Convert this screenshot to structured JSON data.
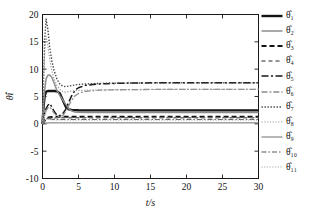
{
  "chart_data": {
    "type": "line",
    "title": "",
    "xlabel": "t/s",
    "ylabel": "θ̂i",
    "xlim": [
      0,
      30
    ],
    "ylim": [
      -10,
      20
    ],
    "xticks": [
      0,
      5,
      10,
      15,
      20,
      25,
      30
    ],
    "yticks": [
      -10,
      -5,
      0,
      5,
      10,
      15,
      20
    ],
    "xticklabels": [
      "0",
      "5",
      "10",
      "15",
      "20",
      "25",
      "30"
    ],
    "yticklabels": [
      "-10",
      "-5",
      "0",
      "5",
      "10",
      "15",
      "20"
    ],
    "grid": false,
    "legend_position": "right-outside",
    "x": [
      0,
      0.15,
      0.3,
      0.5,
      0.75,
      1.0,
      1.3,
      1.6,
      2.0,
      2.4,
      2.8,
      3.2,
      3.6,
      4.0,
      4.5,
      5.0,
      6.0,
      7.0,
      8.0,
      9.0,
      10.0,
      12.0,
      15.0,
      18.0,
      21.0,
      24.0,
      27.0,
      30.0
    ],
    "series": [
      {
        "name": "θ̂₁",
        "label": "θ̂1",
        "color": "#141414",
        "width": 2.4,
        "dash": "none",
        "values": [
          0,
          3.2,
          5.1,
          5.9,
          6.0,
          6.0,
          6.0,
          6.0,
          5.95,
          5.6,
          4.4,
          3.2,
          2.7,
          2.55,
          2.5,
          2.48,
          2.47,
          2.47,
          2.47,
          2.47,
          2.47,
          2.47,
          2.47,
          2.47,
          2.47,
          2.47,
          2.47,
          2.47
        ]
      },
      {
        "name": "θ̂₂",
        "label": "θ̂2",
        "color": "#8c8c8c",
        "width": 1.5,
        "dash": "none",
        "values": [
          0,
          3.6,
          6.2,
          8.2,
          8.9,
          8.95,
          8.5,
          7.5,
          6.1,
          5.2,
          4.4,
          3.6,
          2.9,
          2.4,
          2.15,
          2.1,
          2.08,
          2.08,
          2.08,
          2.08,
          2.08,
          2.08,
          2.08,
          2.08,
          2.08,
          2.08,
          2.08,
          2.08
        ]
      },
      {
        "name": "θ̂₃",
        "label": "θ̂3",
        "color": "#141414",
        "width": 2.0,
        "dash": "5,3",
        "values": [
          0,
          0.3,
          0.6,
          0.9,
          1.1,
          1.2,
          1.25,
          1.3,
          1.3,
          1.3,
          1.3,
          1.3,
          1.3,
          1.3,
          1.3,
          1.3,
          1.3,
          1.3,
          1.3,
          1.3,
          1.3,
          1.3,
          1.3,
          1.3,
          1.3,
          1.3,
          1.3,
          1.3
        ]
      },
      {
        "name": "θ̂₄",
        "label": "θ̂4",
        "color": "#6e6e6e",
        "width": 1.4,
        "dash": "4,3",
        "values": [
          0,
          0.25,
          0.5,
          0.75,
          0.92,
          1.0,
          1.05,
          1.08,
          1.1,
          1.1,
          1.1,
          1.1,
          1.1,
          1.1,
          1.1,
          1.1,
          1.1,
          1.1,
          1.1,
          1.1,
          1.1,
          1.1,
          1.1,
          1.1,
          1.1,
          1.1,
          1.1,
          1.1
        ]
      },
      {
        "name": "θ̂₅",
        "label": "θ̂5",
        "color": "#141414",
        "width": 1.5,
        "dash": "7,2.5,2,2.5",
        "values": [
          0,
          1.0,
          1.9,
          2.8,
          3.4,
          3.7,
          3.1,
          2.3,
          1.6,
          1.5,
          1.8,
          2.6,
          3.8,
          5.0,
          6.1,
          6.6,
          7.05,
          7.2,
          7.3,
          7.35,
          7.4,
          7.45,
          7.5,
          7.5,
          7.5,
          7.5,
          7.5,
          7.5
        ]
      },
      {
        "name": "θ̂₆",
        "label": "θ̂6",
        "color": "#8c8c8c",
        "width": 1.3,
        "dash": "6,2,1.8,2",
        "values": [
          0,
          0.85,
          1.6,
          2.4,
          2.9,
          3.1,
          2.6,
          2.0,
          1.4,
          1.3,
          1.5,
          2.2,
          3.2,
          4.2,
          5.1,
          5.55,
          5.95,
          6.08,
          6.15,
          6.2,
          6.22,
          6.25,
          6.3,
          6.3,
          6.3,
          6.3,
          6.3,
          6.3
        ]
      },
      {
        "name": "θ̂₇",
        "label": "θ̂7",
        "color": "#454545",
        "width": 1.4,
        "dash": "1.4,1.6",
        "values": [
          0,
          8.5,
          15.5,
          19.2,
          17.2,
          14.0,
          11.5,
          9.8,
          8.2,
          7.3,
          6.9,
          6.8,
          6.9,
          7.0,
          7.1,
          7.2,
          7.3,
          7.35,
          7.4,
          7.42,
          7.44,
          7.46,
          7.48,
          7.5,
          7.5,
          7.5,
          7.5,
          7.5
        ]
      },
      {
        "name": "θ̂₈",
        "label": "θ̂8",
        "color": "#9a9a9a",
        "width": 1.2,
        "dash": "1.2,1.6",
        "values": [
          0,
          7.0,
          12.8,
          16.0,
          14.4,
          11.8,
          9.7,
          8.3,
          7.0,
          6.3,
          5.9,
          5.8,
          5.9,
          6.0,
          6.05,
          6.1,
          6.15,
          6.18,
          6.2,
          6.22,
          6.24,
          6.26,
          6.28,
          6.3,
          6.3,
          6.3,
          6.3,
          6.3
        ]
      },
      {
        "name": "θ̂₉",
        "label": "θ̂9",
        "color": "#6e6e6e",
        "width": 1.0,
        "dash": "none",
        "values": [
          0,
          0.05,
          0.1,
          0.14,
          0.16,
          0.17,
          0.18,
          0.18,
          0.18,
          0.18,
          0.18,
          0.18,
          0.18,
          0.18,
          0.18,
          0.18,
          0.18,
          0.18,
          0.18,
          0.18,
          0.18,
          0.18,
          0.18,
          0.18,
          0.18,
          0.18,
          0.18,
          0.18
        ]
      },
      {
        "name": "θ̂₁₀",
        "label": "θ̂10",
        "color": "#5a5a5a",
        "width": 1.1,
        "dash": "5,2,1.5,2",
        "values": [
          0,
          0.4,
          0.75,
          1.0,
          1.0,
          0.9,
          0.85,
          0.82,
          0.8,
          0.8,
          0.8,
          0.8,
          0.8,
          0.8,
          0.8,
          0.8,
          0.8,
          0.8,
          0.8,
          0.8,
          0.8,
          0.8,
          0.8,
          0.8,
          0.8,
          0.8,
          0.8,
          0.8
        ]
      },
      {
        "name": "θ̂₁₁",
        "label": "θ̂11",
        "color": "#a8a8a8",
        "width": 1.0,
        "dash": "1.2,1.5",
        "values": [
          0,
          0.35,
          0.65,
          0.85,
          0.85,
          0.78,
          0.73,
          0.7,
          0.68,
          0.68,
          0.68,
          0.68,
          0.68,
          0.68,
          0.68,
          0.68,
          0.68,
          0.68,
          0.68,
          0.68,
          0.68,
          0.68,
          0.68,
          0.68,
          0.68,
          0.68,
          0.68,
          0.68
        ]
      }
    ]
  }
}
